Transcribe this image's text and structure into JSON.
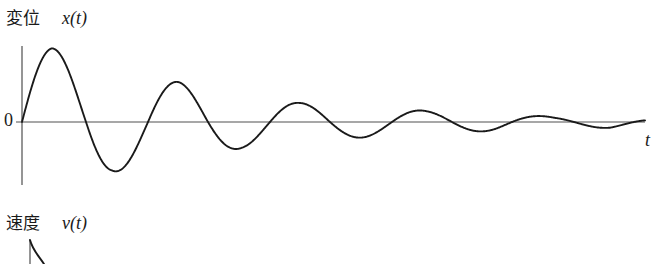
{
  "figure": {
    "background_color": "#ffffff",
    "width": 661,
    "height": 264
  },
  "panels": {
    "displacement": {
      "quantity_label": "変位",
      "symbol_label": "x(t)",
      "origin_label": "0",
      "time_axis_label": "t"
    },
    "velocity": {
      "quantity_label": "速度",
      "symbol_label": "v(t)"
    }
  },
  "colors": {
    "curve": "#1a1a1a",
    "axis": "#8a8a8a",
    "text": "#1a1a1a",
    "background": "#ffffff"
  },
  "chart_data": {
    "type": "line",
    "title": "変位 x(t)",
    "xlabel": "t",
    "ylabel": "x(t)",
    "grid": false,
    "legend": "none",
    "axes": {
      "origin_px": [
        22,
        122
      ],
      "x_axis_end_px": [
        645,
        122
      ],
      "y_axis_top_px": [
        22,
        46
      ],
      "y_axis_bottom_px": [
        22,
        185
      ],
      "velocity_axis_x_px": 30,
      "velocity_axis_top_px": 240,
      "velocity_axis_bottom_px": 264
    },
    "model": {
      "form": "x(t) = A * exp(-t/tau) * sin(2*pi*t/T)",
      "amplitude_A_px": 78,
      "decay_tau_px": 185,
      "period_T_px": 122,
      "phase": 0
    },
    "extrema_px": [
      {
        "kind": "peak",
        "index": 1,
        "x": 52,
        "y": 48
      },
      {
        "kind": "trough",
        "index": 1,
        "x": 112,
        "y": 172
      },
      {
        "kind": "peak",
        "index": 2,
        "x": 178,
        "y": 82
      },
      {
        "kind": "trough",
        "index": 2,
        "x": 242,
        "y": 148
      },
      {
        "kind": "peak",
        "index": 3,
        "x": 300,
        "y": 103
      },
      {
        "kind": "trough",
        "index": 3,
        "x": 372,
        "y": 137
      },
      {
        "kind": "peak",
        "index": 4,
        "x": 428,
        "y": 111
      },
      {
        "kind": "trough",
        "index": 4,
        "x": 495,
        "y": 131
      },
      {
        "kind": "peak",
        "index": 5,
        "x": 555,
        "y": 117
      },
      {
        "kind": "trough",
        "index": 5,
        "x": 610,
        "y": 128
      }
    ],
    "zero_crossings_px": [
      22,
      86,
      148,
      208,
      270,
      330,
      392,
      452,
      512,
      574,
      634
    ],
    "amplitude_envelope_px": [
      {
        "x": 22,
        "amplitude": 78
      },
      {
        "x": 52,
        "amplitude": 74
      },
      {
        "x": 112,
        "amplitude": 50
      },
      {
        "x": 178,
        "amplitude": 40
      },
      {
        "x": 242,
        "amplitude": 26
      },
      {
        "x": 300,
        "amplitude": 19
      },
      {
        "x": 372,
        "amplitude": 15
      },
      {
        "x": 428,
        "amplitude": 11
      },
      {
        "x": 495,
        "amplitude": 9
      },
      {
        "x": 555,
        "amplitude": 5
      },
      {
        "x": 610,
        "amplitude": 6
      },
      {
        "x": 645,
        "amplitude": 3
      }
    ],
    "velocity_curve_px": {
      "start": [
        30,
        240
      ],
      "visible_end": [
        44,
        264
      ],
      "note": "Only the initial descending stroke of the velocity curve is visible; the rest is cropped off the bottom of the image."
    }
  }
}
